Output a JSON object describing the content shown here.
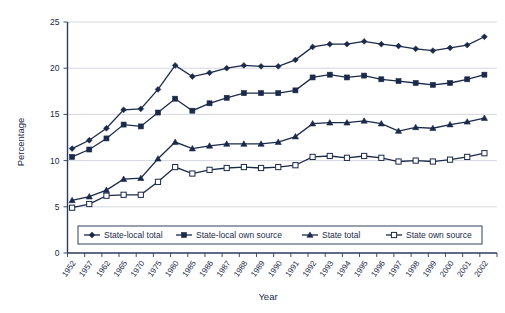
{
  "chart_data": {
    "type": "line",
    "title": "",
    "subtitle": "",
    "xlabel": "Year",
    "ylabel": "Percentage",
    "ylim": [
      0,
      25
    ],
    "yticks": [
      0,
      5,
      10,
      15,
      20,
      25
    ],
    "grid": true,
    "legend_position": "bottom",
    "categories": [
      "1952",
      "1957",
      "1962",
      "1965",
      "1970",
      "1975",
      "1980",
      "1985",
      "1986",
      "1987",
      "1988",
      "1989",
      "1990",
      "1991",
      "1992",
      "1993",
      "1994",
      "1995",
      "1996",
      "1997",
      "1998",
      "1999",
      "2000",
      "2001",
      "2002"
    ],
    "series": [
      {
        "name": "State-local total",
        "marker": "diamond",
        "values": [
          11.3,
          12.2,
          13.5,
          15.5,
          15.6,
          17.7,
          20.3,
          19.1,
          19.5,
          20.0,
          20.3,
          20.2,
          20.2,
          20.9,
          22.3,
          22.6,
          22.6,
          22.9,
          22.6,
          22.4,
          22.1,
          21.9,
          22.2,
          22.5,
          23.4
        ]
      },
      {
        "name": "State-local own source",
        "marker": "square-filled",
        "values": [
          10.4,
          11.2,
          12.4,
          13.9,
          13.7,
          15.2,
          16.7,
          15.4,
          16.2,
          16.8,
          17.3,
          17.3,
          17.3,
          17.6,
          19.0,
          19.3,
          19.0,
          19.2,
          18.8,
          18.6,
          18.4,
          18.2,
          18.4,
          18.8,
          19.3
        ]
      },
      {
        "name": "State total",
        "marker": "triangle",
        "values": [
          5.7,
          6.1,
          6.8,
          8.0,
          8.1,
          10.2,
          12.0,
          11.3,
          11.6,
          11.8,
          11.8,
          11.8,
          12.0,
          12.6,
          14.0,
          14.1,
          14.1,
          14.3,
          14.0,
          13.2,
          13.6,
          13.5,
          13.9,
          14.2,
          14.6
        ]
      },
      {
        "name": "State own source",
        "marker": "square-open",
        "values": [
          4.9,
          5.3,
          6.2,
          6.3,
          6.3,
          7.7,
          9.3,
          8.6,
          9.0,
          9.2,
          9.3,
          9.2,
          9.3,
          9.5,
          10.4,
          10.5,
          10.3,
          10.5,
          10.3,
          9.9,
          10.0,
          9.9,
          10.1,
          10.4,
          10.8
        ]
      }
    ],
    "colors": {
      "series_line": "#1b2a4a",
      "gridline": "#c9cdd6",
      "axis": "#2b3a5c",
      "background": "#ffffff"
    }
  }
}
